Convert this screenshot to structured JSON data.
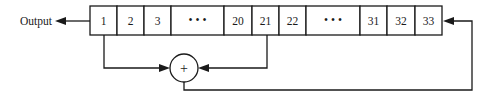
{
  "diagram": {
    "type": "shift-register-with-feedback",
    "output_label": "Output",
    "adder_symbol": "+",
    "register": {
      "top": 6,
      "bottom": 35,
      "cells": [
        {
          "label": "1",
          "x0": 90,
          "x1": 117
        },
        {
          "label": "2",
          "x0": 117,
          "x1": 144
        },
        {
          "label": "3",
          "x0": 144,
          "x1": 171
        },
        {
          "label": "• • •",
          "x0": 171,
          "x1": 224
        },
        {
          "label": "20",
          "x0": 224,
          "x1": 252
        },
        {
          "label": "21",
          "x0": 252,
          "x1": 279
        },
        {
          "label": "22",
          "x0": 279,
          "x1": 306
        },
        {
          "label": "• • •",
          "x0": 306,
          "x1": 360
        },
        {
          "label": "31",
          "x0": 360,
          "x1": 387
        },
        {
          "label": "32",
          "x0": 387,
          "x1": 415
        },
        {
          "label": "33",
          "x0": 415,
          "x1": 442
        }
      ]
    },
    "taps": [
      "1",
      "21"
    ],
    "feedback_into": "33",
    "colors": {
      "line": "#1a1a1a",
      "background": "#ffffff"
    }
  }
}
